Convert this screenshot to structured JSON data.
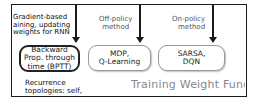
{
  "diagram": {
    "top_labels": {
      "gradient": [
        "Gradient-based",
        "aining, updating",
        "weights for RNN"
      ],
      "off_policy": [
        "Off-policy",
        "method"
      ],
      "on_policy": [
        "On-policy",
        "method"
      ]
    },
    "boxes": {
      "bptt": [
        "Backward",
        "Prop. through",
        "time (BPTT)"
      ],
      "mdp": [
        "MDP,",
        "Q-Learning"
      ],
      "sarsa": [
        "SARSA,",
        "DQN"
      ]
    },
    "recurrence_note": [
      "Recurrence",
      "topologies: self,"
    ],
    "section_title": "Training Weight Funct",
    "colors": {
      "frame": "#1a1a1a",
      "title_grey": "#888888",
      "light_box_border": "#999999"
    }
  }
}
